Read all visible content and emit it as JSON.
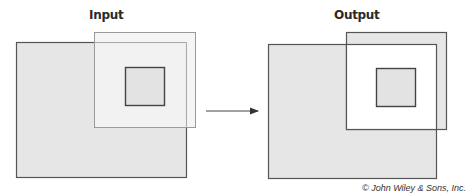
{
  "panels": {
    "input": {
      "title": "Input",
      "image_rect": {
        "x": 16,
        "y": 42,
        "w": 170,
        "h": 135
      },
      "selection_rect": {
        "x": 94,
        "y": 32,
        "w": 101,
        "h": 95
      },
      "inner_square": {
        "x": 125,
        "y": 67,
        "w": 39,
        "h": 38
      }
    },
    "output": {
      "title": "Output",
      "image_rect": {
        "x": 268,
        "y": 44,
        "w": 168,
        "h": 134
      },
      "selection_rect": {
        "x": 346,
        "y": 32,
        "w": 100,
        "h": 97
      },
      "inner_square": {
        "x": 376,
        "y": 68,
        "w": 39,
        "h": 38
      }
    }
  },
  "arrow": {
    "x1": 206,
    "y1": 111,
    "x2": 259,
    "y2": 111
  },
  "colors": {
    "image_fill": "#e6e6e6",
    "selection_fill_input": "#f2f2f2",
    "selection_fill_output": "#e6e6e6",
    "output_interior": "#ffffff",
    "stroke_dark": "#555555",
    "stroke_light": "#9a9a9a"
  },
  "credit": "© John Wiley & Sons, Inc."
}
